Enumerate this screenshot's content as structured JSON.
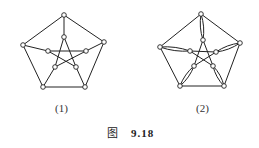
{
  "figure": {
    "caption_prefix": "图",
    "caption_number": "9.18",
    "subfigures": [
      {
        "label": "(1)",
        "description": "Petersen graph",
        "outer_vertices": [
          [
            64,
            15
          ],
          [
            104,
            42
          ],
          [
            85,
            87
          ],
          [
            43,
            87
          ],
          [
            23,
            45
          ]
        ],
        "inner_vertices": [
          [
            64,
            37
          ],
          [
            86,
            51
          ],
          [
            76,
            67
          ],
          [
            55,
            67
          ],
          [
            48,
            51
          ]
        ]
      },
      {
        "label": "(2)",
        "description": "Petersen graph with doubled spokes (multigraph)",
        "outer_vertices": [
          [
            201,
            14
          ],
          [
            240,
            43
          ],
          [
            224,
            86
          ],
          [
            180,
            86
          ],
          [
            160,
            47
          ]
        ],
        "inner_vertices": [
          [
            203,
            40
          ],
          [
            216,
            52
          ],
          [
            213,
            66
          ],
          [
            194,
            66
          ],
          [
            190,
            51
          ]
        ]
      }
    ]
  }
}
